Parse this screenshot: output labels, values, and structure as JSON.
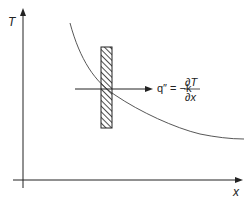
{
  "diagram": {
    "y_axis_label": "T",
    "x_axis_label": "x",
    "flux_label": "q″ = −k",
    "derivative_numerator": "∂T",
    "derivative_denominator": "∂x",
    "colors": {
      "stroke": "#222222",
      "curve": "#444444",
      "background": "#ffffff"
    }
  }
}
